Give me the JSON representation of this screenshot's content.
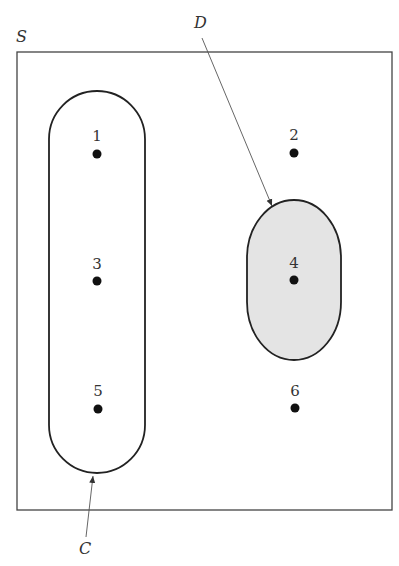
{
  "diagram": {
    "type": "venn-sample-space",
    "colors": {
      "stroke": "#222222",
      "event_d_fill": "#e4e4e4",
      "point": "#111111",
      "background": "#ffffff"
    },
    "sample_space": {
      "label": "S"
    },
    "events": [
      {
        "label": "C",
        "members": [
          "1",
          "3",
          "5"
        ],
        "shaded": false
      },
      {
        "label": "D",
        "members": [
          "4"
        ],
        "shaded": true
      }
    ],
    "points": [
      {
        "label": "1"
      },
      {
        "label": "2"
      },
      {
        "label": "3"
      },
      {
        "label": "4"
      },
      {
        "label": "5"
      },
      {
        "label": "6"
      }
    ]
  }
}
